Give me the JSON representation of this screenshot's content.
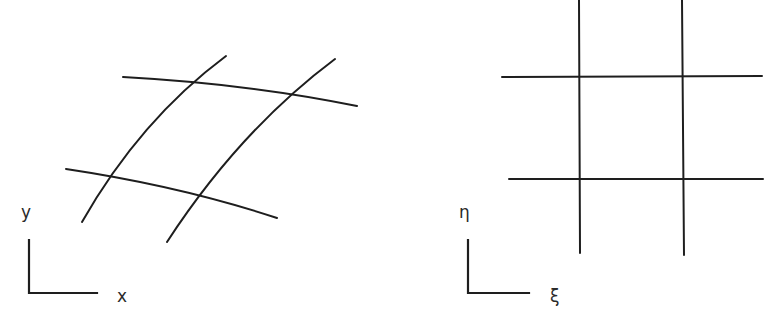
{
  "diagram": {
    "type": "coordinate-mapping",
    "physical_domain": {
      "axis_labels": {
        "horizontal": "x",
        "vertical": "y"
      },
      "grid_lines": 4,
      "curved": true
    },
    "computational_domain": {
      "axis_labels": {
        "horizontal": "ξ",
        "vertical": "η"
      },
      "grid_lines": 4,
      "curved": false
    },
    "colors": {
      "stroke": "#1e1e1e",
      "background": "#ffffff"
    }
  }
}
